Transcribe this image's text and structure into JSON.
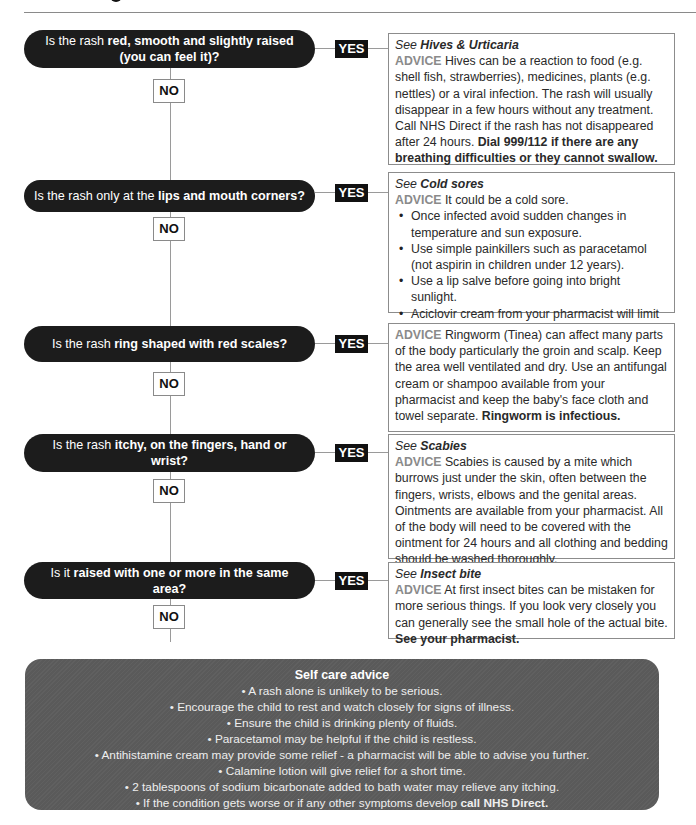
{
  "flowchart": {
    "steps": [
      {
        "question_pre": "Is the rash ",
        "question_bold": "red, smooth and slightly raised (you can feel it)?",
        "question_post": "",
        "yes_label": "YES",
        "no_label": "NO",
        "advice": {
          "see_prefix": "See ",
          "see_topic": "Hives & Urticaria",
          "advice_label": "ADVICE",
          "text": " Hives can be a reaction to food (e.g. shell fish, strawberries), medicines, plants (e.g. nettles) or a viral infection. The rash will usually disappear in a few hours without any treatment. Call NHS Direct if the rash has not disappeared after 24 hours. ",
          "bold_text": "Dial 999/112 if there are any breathing difficulties or they cannot swallow."
        }
      },
      {
        "question_pre": "Is the rash only at the ",
        "question_bold": "lips and mouth corners?",
        "question_post": "",
        "yes_label": "YES",
        "no_label": "NO",
        "advice": {
          "see_prefix": "See ",
          "see_topic": "Cold sores",
          "advice_label": "ADVICE",
          "text": " It could be a cold sore.",
          "bullets": [
            "Once infected avoid sudden changes in temperature and sun exposure.",
            "Use simple painkillers such as paracetamol (not aspirin in children under 12 years).",
            "Use a lip salve before going into bright sunlight.",
            "Aciclovir cream from your pharmacist will limit the outbreak."
          ]
        }
      },
      {
        "question_pre": "Is the rash ",
        "question_bold": "ring shaped with red scales?",
        "question_post": "",
        "yes_label": "YES",
        "no_label": "NO",
        "advice": {
          "advice_label": "ADVICE",
          "text": " Ringworm (Tinea) can affect many parts of the body particularly the groin and scalp. Keep the area well ventilated and dry. Use an antifungal cream or shampoo available from your pharmacist and keep the baby's face cloth and towel separate. ",
          "bold_text": "Ringworm is infectious."
        }
      },
      {
        "question_pre": "Is the rash ",
        "question_bold": "itchy, on the fingers, hand or wrist?",
        "question_post": "",
        "yes_label": "YES",
        "no_label": "NO",
        "advice": {
          "see_prefix": "See ",
          "see_topic": "Scabies",
          "advice_label": "ADVICE",
          "text": " Scabies is caused by a mite which burrows just under the skin, often between the fingers, wrists, elbows and the genital areas. Ointments are available from your pharmacist. All of the body will need to be covered with the ointment for 24 hours and all clothing and bedding should be washed thoroughly."
        }
      },
      {
        "question_pre": "Is it ",
        "question_bold": "raised with one or more in the same area?",
        "question_post": "",
        "yes_label": "YES",
        "no_label": "NO",
        "advice": {
          "see_prefix": "See ",
          "see_topic": "Insect bite",
          "advice_label": "ADVICE",
          "text": " At first insect bites can be mistaken for more serious things. If you look very closely you can generally see the small hole of the actual bite. ",
          "bold_text": "See your pharmacist."
        }
      }
    ]
  },
  "self_care": {
    "title": "Self care advice",
    "items": [
      "A rash alone is unlikely to be serious.",
      "Encourage the child to rest and watch closely for signs of illness.",
      "Ensure the child is drinking plenty of fluids.",
      "Paracetamol may be helpful if the child is restless.",
      "Antihistamine cream may provide some relief - a pharmacist will be able to advise you further.",
      "Calamine lotion will give relief for a short time.",
      "2 tablespoons of sodium bicarbonate added to bath water may relieve any itching."
    ],
    "last_item_text": "If the condition gets worse or if any other symptoms develop ",
    "last_item_bold": "call NHS Direct."
  },
  "colors": {
    "question_bg": "#1c1c1c",
    "yes_bg": "#111111",
    "advice_label": "#8a8a8a",
    "self_care_bg": "#5a5a5a",
    "connector": "#9a9a9a"
  }
}
